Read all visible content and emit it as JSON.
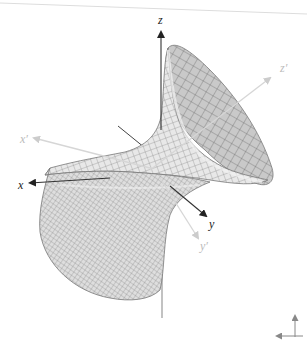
{
  "view": {
    "type": "3d-graphics-view",
    "surface": "hyperboloid-of-one-sheet",
    "surface_fill": "#e6e6e6",
    "surface_fill_dark": "#c8c8c8",
    "grid_color": "#666666",
    "axis_color": "#222222",
    "prime_axis_color": "#d0d0d0"
  },
  "axes": {
    "x": "x",
    "y": "y",
    "z": "z",
    "x_prime": "x′",
    "y_prime": "y′",
    "z_prime": "z′"
  },
  "widget": {
    "name": "axes-orientation-indicator"
  }
}
